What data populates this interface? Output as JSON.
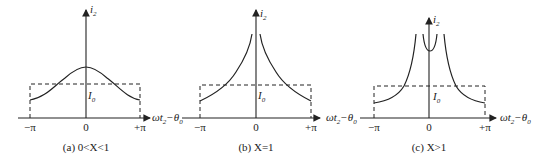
{
  "figure": {
    "panels": [
      {
        "id": "a",
        "caption": "(a) 0<X<1",
        "y_axis_label": "i",
        "y_axis_sub": "2",
        "x_axis_label": "ωt",
        "x_axis_sub": "2",
        "x_axis_suffix": "−θ",
        "x_axis_suffix_sub": "0",
        "level_label": "I",
        "level_sub": "0",
        "ticks": [
          "−π",
          "0",
          "+π"
        ],
        "curve_shape": "bell"
      },
      {
        "id": "b",
        "caption": "(b) X=1",
        "y_axis_label": "i",
        "y_axis_sub": "2",
        "x_axis_label": "ωt",
        "x_axis_sub": "2",
        "x_axis_suffix": "−θ",
        "x_axis_suffix_sub": "0",
        "level_label": "I",
        "level_sub": "0",
        "ticks": [
          "−π",
          "0",
          "+π"
        ],
        "curve_shape": "cusp"
      },
      {
        "id": "c",
        "caption": "(c) X>1",
        "y_axis_label": "i",
        "y_axis_sub": "2",
        "x_axis_label": "ωt",
        "x_axis_sub": "2",
        "x_axis_suffix": "−θ",
        "x_axis_suffix_sub": "0",
        "level_label": "I",
        "level_sub": "0",
        "ticks": [
          "−π",
          "0",
          "+π"
        ],
        "curve_shape": "split"
      }
    ]
  }
}
